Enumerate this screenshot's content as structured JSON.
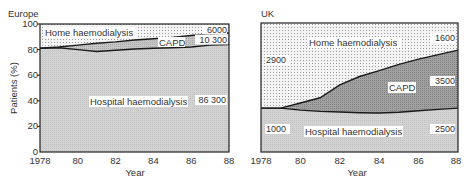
{
  "chart_data": [
    {
      "type": "area",
      "title": "Europe",
      "xlabel": "Year",
      "ylabel": "Patients (%)",
      "stacked": true,
      "x": [
        1978,
        1979,
        1980,
        1981,
        1982,
        1983,
        1984,
        1985,
        1986,
        1987,
        1988
      ],
      "xticks": [
        1978,
        1980,
        1982,
        1984,
        1986,
        1988
      ],
      "xtick_labels": [
        "1978",
        "80",
        "82",
        "84",
        "86",
        "88"
      ],
      "yticks": [
        0,
        20,
        40,
        60,
        80,
        100
      ],
      "ylim": [
        0,
        100
      ],
      "xlim": [
        1978,
        1988
      ],
      "grid": false,
      "legend": "inline labels",
      "series": [
        {
          "name": "Hospital haemodialysis",
          "cumulative_top_pct": [
            81,
            81.5,
            80,
            78.5,
            79.5,
            80.5,
            81,
            81.5,
            82,
            83.5,
            84
          ],
          "end_count": "86 300"
        },
        {
          "name": "CAPD",
          "cumulative_top_pct": [
            81,
            82,
            83.5,
            85,
            86,
            87.5,
            88.5,
            89.5,
            91,
            92.5,
            93
          ],
          "end_count": "10 300"
        },
        {
          "name": "Home haemodialysis",
          "cumulative_top_pct": [
            100,
            100,
            100,
            100,
            100,
            100,
            100,
            100,
            100,
            100,
            100
          ],
          "end_count": "6000"
        }
      ]
    },
    {
      "type": "area",
      "title": "UK",
      "xlabel": "Year",
      "ylabel": "",
      "stacked": true,
      "x": [
        1978,
        1979,
        1980,
        1981,
        1982,
        1983,
        1984,
        1985,
        1986,
        1987,
        1988
      ],
      "xticks": [
        1978,
        1980,
        1982,
        1984,
        1986,
        1988
      ],
      "xtick_labels": [
        "1978",
        "80",
        "82",
        "84",
        "86",
        "88"
      ],
      "ylim": [
        0,
        100
      ],
      "xlim": [
        1978,
        1988
      ],
      "grid": false,
      "legend": "inline labels",
      "series": [
        {
          "name": "Hospital haemodialysis",
          "cumulative_top_pct": [
            34,
            34,
            32.5,
            31.5,
            31,
            30.5,
            30.2,
            30.8,
            32,
            33,
            34
          ],
          "start_count": "1000",
          "end_count": "2500"
        },
        {
          "name": "CAPD",
          "cumulative_top_pct": [
            34,
            34,
            38,
            42,
            52,
            58.5,
            63,
            68,
            72,
            75.5,
            79
          ],
          "end_count": "3500"
        },
        {
          "name": "Home haemodialysis",
          "cumulative_top_pct": [
            100,
            100,
            100,
            100,
            100,
            100,
            100,
            100,
            100,
            100,
            100
          ],
          "start_count": "2900",
          "end_count": "1600"
        }
      ]
    }
  ],
  "colors": {
    "hospital_fill": "#cdcdcd",
    "capd_fill_europe": "#b9b9b9",
    "capd_fill_uk": "#9a9a9a",
    "home_fill": "#f4f4f4",
    "home_dot": "#9c9c9c",
    "line": "#1a1a1a",
    "axis": "#222222"
  },
  "labels": {
    "europe": {
      "title": "Europe",
      "ylabel": "Patients (%)",
      "xlabel": "Year",
      "home": "Home haemodialysis",
      "capd": "CAPD",
      "hospital": "Hospital haemodialysis",
      "home_count": "6000",
      "capd_count": "10 300",
      "hospital_count": "86 300"
    },
    "uk": {
      "title": "UK",
      "xlabel": "Year",
      "home": "Home haemodialysis",
      "capd": "CAPD",
      "hospital": "Hospital haemodialysis",
      "home_start": "2900",
      "home_end": "1600",
      "capd_end": "3500",
      "hospital_start": "1000",
      "hospital_end": "2500"
    }
  }
}
